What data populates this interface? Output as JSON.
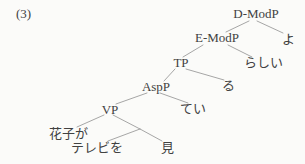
{
  "figure": {
    "example_label": "(3)",
    "type": "syntax-tree",
    "background_color": "#fbfbf9",
    "text_color": "#414141",
    "line_color": "#9c9c9c"
  },
  "tree": {
    "root": "D-ModP",
    "nodes": {
      "dmodp": "D-ModP",
      "emodp": "E-ModP",
      "yo": "よ",
      "tp": "TP",
      "rashii": "らしい",
      "aspp": "AspP",
      "ru": "る",
      "vp": "VP",
      "tei": "てい",
      "hanakoga": "花子が",
      "terebio": "テレビを",
      "mi": "見"
    },
    "edges": [
      {
        "from": "D-ModP",
        "to": "E-ModP"
      },
      {
        "from": "D-ModP",
        "to": "よ"
      },
      {
        "from": "E-ModP",
        "to": "TP"
      },
      {
        "from": "E-ModP",
        "to": "らしい"
      },
      {
        "from": "TP",
        "to": "AspP"
      },
      {
        "from": "TP",
        "to": "る"
      },
      {
        "from": "AspP",
        "to": "VP"
      },
      {
        "from": "AspP",
        "to": "てい"
      },
      {
        "from": "VP",
        "to": "花子が"
      },
      {
        "from": "VP",
        "to": "(unlabeled)"
      },
      {
        "from": "(unlabeled)",
        "to": "テレビを"
      },
      {
        "from": "(unlabeled)",
        "to": "見"
      }
    ]
  }
}
